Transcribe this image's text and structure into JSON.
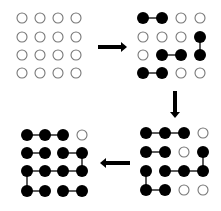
{
  "diagram": {
    "colors": {
      "filled": "#000000",
      "empty_stroke": "#777777",
      "edge": "#333333",
      "arrow": "#000000",
      "background": "#ffffff"
    },
    "grids": [
      {
        "id": "grid-1",
        "position": "top-left",
        "xs": [
          22,
          40,
          58,
          76
        ],
        "ys": [
          18,
          37,
          55,
          73
        ],
        "filled": [],
        "edges": []
      },
      {
        "id": "grid-2",
        "position": "top-right",
        "xs": [
          143,
          162,
          181,
          200
        ],
        "ys": [
          18,
          37,
          55,
          73
        ],
        "filled": [
          [
            0,
            0
          ],
          [
            0,
            1
          ],
          [
            1,
            3
          ],
          [
            2,
            1
          ],
          [
            2,
            2
          ],
          [
            2,
            3
          ],
          [
            3,
            0
          ],
          [
            3,
            1
          ]
        ],
        "edges": [
          [
            [
              0,
              0
            ],
            [
              0,
              1
            ]
          ],
          [
            [
              1,
              3
            ],
            [
              2,
              3
            ]
          ],
          [
            [
              2,
              1
            ],
            [
              2,
              2
            ]
          ],
          [
            [
              3,
              0
            ],
            [
              3,
              1
            ]
          ]
        ]
      },
      {
        "id": "grid-3",
        "position": "bottom-right",
        "xs": [
          146,
          165,
          184,
          203
        ],
        "ys": [
          133,
          152,
          171,
          190
        ],
        "filled": [
          [
            0,
            0
          ],
          [
            0,
            1
          ],
          [
            0,
            2
          ],
          [
            1,
            0
          ],
          [
            1,
            1
          ],
          [
            1,
            3
          ],
          [
            2,
            0
          ],
          [
            2,
            1
          ],
          [
            2,
            2
          ],
          [
            2,
            3
          ],
          [
            3,
            0
          ],
          [
            3,
            1
          ]
        ],
        "edges": [
          [
            [
              0,
              0
            ],
            [
              0,
              1
            ]
          ],
          [
            [
              0,
              1
            ],
            [
              0,
              2
            ]
          ],
          [
            [
              1,
              0
            ],
            [
              1,
              1
            ]
          ],
          [
            [
              1,
              3
            ],
            [
              2,
              3
            ]
          ],
          [
            [
              2,
              1
            ],
            [
              2,
              2
            ]
          ],
          [
            [
              2,
              2
            ],
            [
              2,
              3
            ]
          ],
          [
            [
              2,
              0
            ],
            [
              3,
              0
            ]
          ],
          [
            [
              3,
              0
            ],
            [
              3,
              1
            ]
          ]
        ]
      },
      {
        "id": "grid-4",
        "position": "bottom-left",
        "xs": [
          27,
          45,
          63,
          82
        ],
        "ys": [
          135,
          153,
          171,
          191
        ],
        "filled": [
          [
            0,
            0
          ],
          [
            0,
            1
          ],
          [
            0,
            2
          ],
          [
            1,
            0
          ],
          [
            1,
            1
          ],
          [
            1,
            2
          ],
          [
            1,
            3
          ],
          [
            2,
            0
          ],
          [
            2,
            1
          ],
          [
            2,
            2
          ],
          [
            2,
            3
          ],
          [
            3,
            0
          ],
          [
            3,
            1
          ],
          [
            3,
            2
          ],
          [
            3,
            3
          ]
        ],
        "edges": [
          [
            [
              0,
              0
            ],
            [
              0,
              1
            ]
          ],
          [
            [
              0,
              1
            ],
            [
              0,
              2
            ]
          ],
          [
            [
              1,
              0
            ],
            [
              1,
              1
            ]
          ],
          [
            [
              1,
              2
            ],
            [
              1,
              3
            ]
          ],
          [
            [
              1,
              3
            ],
            [
              2,
              3
            ]
          ],
          [
            [
              2,
              0
            ],
            [
              2,
              1
            ]
          ],
          [
            [
              2,
              1
            ],
            [
              2,
              2
            ]
          ],
          [
            [
              2,
              2
            ],
            [
              2,
              3
            ]
          ],
          [
            [
              2,
              0
            ],
            [
              3,
              0
            ]
          ],
          [
            [
              3,
              0
            ],
            [
              3,
              1
            ]
          ],
          [
            [
              3,
              2
            ],
            [
              3,
              3
            ]
          ]
        ]
      }
    ],
    "arrows": [
      {
        "id": "arrow-right",
        "direction": "right",
        "from": [
          98,
          47
        ],
        "to": [
          127,
          47
        ]
      },
      {
        "id": "arrow-down",
        "direction": "down",
        "from": [
          175,
          91
        ],
        "to": [
          175,
          118
        ]
      },
      {
        "id": "arrow-left",
        "direction": "left",
        "from": [
          130,
          163
        ],
        "to": [
          100,
          163
        ]
      }
    ],
    "node_radius_empty": 5,
    "node_radius_filled": 6
  }
}
